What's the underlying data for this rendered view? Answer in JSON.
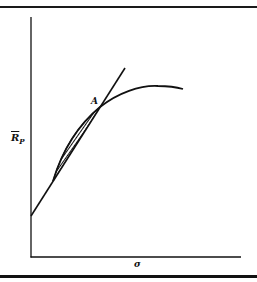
{
  "diagram": {
    "type": "efficient-frontier-with-tangent-line",
    "labels": {
      "point": "A",
      "y_axis_main": "R",
      "y_axis_sub": "P",
      "x_axis": "σ"
    },
    "elements": [
      {
        "name": "y-axis",
        "description": "vertical axis for expected portfolio return"
      },
      {
        "name": "x-axis",
        "description": "horizontal axis for standard deviation"
      },
      {
        "name": "tangent-line",
        "description": "straight line from y-intercept through point A"
      },
      {
        "name": "frontier-curve",
        "description": "concave curve rising to a peak then declining"
      },
      {
        "name": "shaded-region",
        "description": "hatched lens-shaped area between line and curve below A"
      }
    ],
    "colors": {
      "ink": "#111111",
      "background": "#ffffff"
    }
  }
}
